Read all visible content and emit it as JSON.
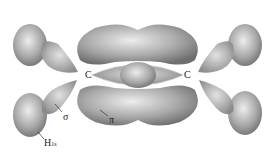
{
  "diagram": {
    "labels": {
      "carbon_left": "C",
      "carbon_right": "C",
      "sigma": "σ",
      "pi": "π",
      "hydrogen": "H",
      "hydrogen_sub": "1s"
    },
    "colors": {
      "lobe_fill": "#9a9a9a",
      "lobe_highlight": "#e8e8e8",
      "background": "#ffffff"
    }
  }
}
